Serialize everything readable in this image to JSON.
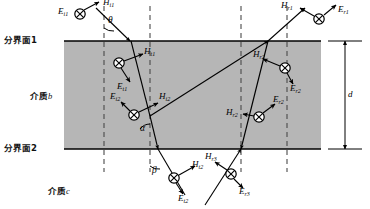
{
  "figure": {
    "type": "physics-ray-diagram",
    "colors": {
      "slab_fill": "#b6b6b6",
      "line": "#000000",
      "dashed": "#555555",
      "background": "#ffffff"
    }
  },
  "interfaces": [
    {
      "id": "interface-1",
      "label": "分界面1",
      "y": 41
    },
    {
      "id": "interface-2",
      "label": "分界面2",
      "y": 149
    }
  ],
  "media": [
    {
      "id": "medium-b",
      "label_cn": "介质",
      "label_sym": "b",
      "x": 30,
      "y": 95
    },
    {
      "id": "medium-c",
      "label_cn": "介质",
      "label_sym": "c",
      "x": 48,
      "y": 190
    }
  ],
  "dimension": {
    "label": "d",
    "x": 340,
    "y_top": 41,
    "y_bottom": 149
  },
  "angles": [
    {
      "id": "angle-theta",
      "label": "θ",
      "x": 104,
      "y": 22
    },
    {
      "id": "angle-alpha",
      "label": "α",
      "x": 141,
      "y": 120
    },
    {
      "id": "angle-beta",
      "label": "β",
      "x": 150,
      "y": 172
    }
  ],
  "vectors": [
    {
      "id": "E-i1",
      "sym": "E",
      "sub": "i1",
      "x": 62,
      "y": 8
    },
    {
      "id": "H-i1",
      "sym": "H",
      "sub": "i1",
      "x": 107,
      "y": 0
    },
    {
      "id": "H-r1",
      "sym": "H",
      "sub": "r1",
      "x": 290,
      "y": 4
    },
    {
      "id": "E-r1",
      "sym": "E",
      "sub": "r1",
      "x": 340,
      "y": 10
    },
    {
      "id": "H-t1",
      "sym": "H",
      "sub": "t1",
      "x": 146,
      "y": 57
    },
    {
      "id": "E-t1",
      "sym": "E",
      "sub": "t1",
      "x": 119,
      "y": 84
    },
    {
      "id": "H-r2-up",
      "sym": "H",
      "sub": "r2",
      "x": 262,
      "y": 56
    },
    {
      "id": "E-r2-up",
      "sym": "E",
      "sub": "r2",
      "x": 294,
      "y": 84
    },
    {
      "id": "E-i2",
      "sym": "E",
      "sub": "i2",
      "x": 112,
      "y": 94
    },
    {
      "id": "H-i2",
      "sym": "H",
      "sub": "i2",
      "x": 160,
      "y": 96
    },
    {
      "id": "H-r2-low",
      "sym": "H",
      "sub": "r2",
      "x": 236,
      "y": 113
    },
    {
      "id": "E-r2-low",
      "sym": "E",
      "sub": "r2",
      "x": 277,
      "y": 105
    },
    {
      "id": "H-t2",
      "sym": "H",
      "sub": "t2",
      "x": 185,
      "y": 169
    },
    {
      "id": "E-t2",
      "sym": "E",
      "sub": "t2",
      "x": 162,
      "y": 196
    },
    {
      "id": "H-r3",
      "sym": "H",
      "sub": "r3",
      "x": 219,
      "y": 155
    },
    {
      "id": "E-r3",
      "sym": "E",
      "sub": "r3",
      "x": 242,
      "y": 188
    }
  ]
}
